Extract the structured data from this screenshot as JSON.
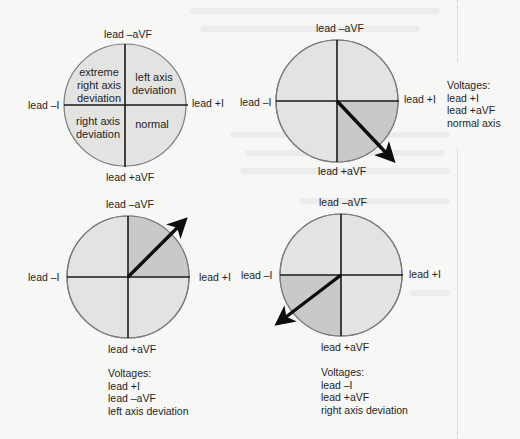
{
  "colors": {
    "quadrant_fill": "#e3e3e1",
    "highlight_fill": "#c9c9c7",
    "circle_stroke": "#7a7a7a",
    "axis_line": "#1a1a1a",
    "arrow": "#0d0d0d"
  },
  "diagram1": {
    "label_top": "lead –aVF",
    "label_bottom": "lead +aVF",
    "label_left": "lead –I",
    "label_right": "lead +I",
    "quadrants": {
      "upper_left": "extreme right axis deviation",
      "upper_left_lines": [
        "extreme",
        "right axis",
        "deviation"
      ],
      "upper_right_lines": [
        "left axis",
        "deviation"
      ],
      "lower_left_lines": [
        "right axis",
        "deviation"
      ],
      "lower_right_lines": [
        "normal"
      ]
    }
  },
  "diagram2": {
    "label_top": "lead –aVF",
    "label_bottom": "lead +aVF",
    "label_left": "lead –I",
    "label_right": "lead +I",
    "highlighted_quadrant": "lower-right",
    "arrow_direction": "down-right",
    "caption": {
      "title": "Voltages:",
      "lines": [
        "lead +I",
        "lead +aVF",
        "normal axis"
      ]
    }
  },
  "diagram3": {
    "label_top": "lead –aVF",
    "label_bottom": "lead +aVF",
    "label_left": "lead –I",
    "label_right": "lead +I",
    "highlighted_quadrant": "upper-right",
    "arrow_direction": "up-right",
    "caption": {
      "title": "Voltages:",
      "lines": [
        "lead +I",
        "lead –aVF",
        "left axis deviation"
      ]
    }
  },
  "diagram4": {
    "label_top": "lead –aVF",
    "label_bottom": "lead +aVF",
    "label_left": "lead –I",
    "label_right": "lead +I",
    "highlighted_quadrant": "lower-left",
    "arrow_direction": "down-left",
    "caption": {
      "title": "Voltages:",
      "lines": [
        "lead –I",
        "lead +aVF",
        "right axis deviation"
      ]
    }
  }
}
